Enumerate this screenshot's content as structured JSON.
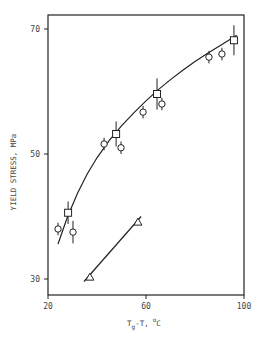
{
  "chart_data": {
    "type": "scatter",
    "title": "",
    "xlabel": "Tg-T, °C",
    "xlabel_parts": {
      "main": "T",
      "sub": "g",
      "rest": "-T,",
      "deg": "o",
      "unit": "C"
    },
    "ylabel": "YIELD STRESS, MPa",
    "xlim": [
      20,
      100
    ],
    "ylim": [
      30,
      70
    ],
    "x_ticks": [
      20,
      60,
      100
    ],
    "y_ticks": [
      30,
      50,
      70
    ],
    "grid": false,
    "legend": null,
    "series": [
      {
        "name": "circles",
        "marker": "circle",
        "points": [
          {
            "x": 24.1,
            "y": 38.0,
            "err": 1.0
          },
          {
            "x": 30.2,
            "y": 37.5,
            "err": 1.8
          },
          {
            "x": 42.9,
            "y": 51.6,
            "err": 1.0
          },
          {
            "x": 49.8,
            "y": 51.0,
            "err": 1.0
          },
          {
            "x": 58.8,
            "y": 56.7,
            "err": 1.0
          },
          {
            "x": 66.5,
            "y": 58.0,
            "err": 1.0
          },
          {
            "x": 85.7,
            "y": 65.5,
            "err": 1.0
          },
          {
            "x": 91.0,
            "y": 66.0,
            "err": 1.0
          }
        ]
      },
      {
        "name": "squares",
        "marker": "square",
        "points": [
          {
            "x": 28.2,
            "y": 40.6,
            "err": 1.8
          },
          {
            "x": 47.8,
            "y": 53.2,
            "err": 2.0
          },
          {
            "x": 64.5,
            "y": 59.6,
            "err": 2.5
          },
          {
            "x": 95.9,
            "y": 68.2,
            "err": 2.4
          }
        ]
      },
      {
        "name": "triangles",
        "marker": "triangle",
        "points": [
          {
            "x": 37.1,
            "y": 30.3
          },
          {
            "x": 56.7,
            "y": 39.1
          }
        ]
      }
    ],
    "fit_curves": [
      {
        "name": "upper-fit-curve",
        "points": [
          [
            24.1,
            35.6
          ],
          [
            28,
            40.0
          ],
          [
            32,
            43.7
          ],
          [
            36,
            46.8
          ],
          [
            40,
            49.4
          ],
          [
            45,
            52.2
          ],
          [
            50,
            54.5
          ],
          [
            55,
            56.6
          ],
          [
            60,
            58.5
          ],
          [
            65,
            60.3
          ],
          [
            70,
            61.9
          ],
          [
            75,
            63.4
          ],
          [
            80,
            64.8
          ],
          [
            85,
            66.1
          ],
          [
            90,
            67.3
          ],
          [
            97,
            69.0
          ]
        ]
      },
      {
        "name": "lower-fit-line",
        "points": [
          [
            34.7,
            29.6
          ],
          [
            58.0,
            40.0
          ]
        ]
      }
    ]
  }
}
